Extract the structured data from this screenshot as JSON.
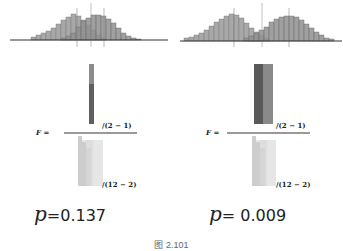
{
  "figure": {
    "caption": "图 2.101",
    "panels": [
      {
        "id": "left",
        "histogram": {
          "groupA_bins": [
            1,
            2,
            4,
            6,
            9,
            12,
            15,
            18,
            20,
            18,
            14,
            10,
            6,
            3,
            1,
            0,
            0,
            0,
            0,
            0,
            0
          ],
          "groupB_bins": [
            0,
            0,
            0,
            0,
            0,
            0,
            1,
            3,
            6,
            10,
            14,
            18,
            20,
            18,
            15,
            12,
            9,
            6,
            4,
            2,
            1
          ],
          "mean_lines": [
            "mean-A",
            "grand-mean",
            "mean-B"
          ]
        },
        "formula": {
          "label": "F =",
          "numerator_df": "/(2 − 1)",
          "denominator_df": "/(12 − 2)"
        },
        "p_label": "p",
        "p_value": "=0.137"
      },
      {
        "id": "right",
        "histogram": {
          "groupA_bins": [
            1,
            2,
            3,
            5,
            8,
            11,
            15,
            19,
            22,
            24,
            23,
            19,
            14,
            9,
            5,
            2,
            1,
            0,
            0,
            0,
            0,
            0,
            0,
            0,
            0,
            0,
            0,
            0,
            0
          ],
          "groupB_bins": [
            0,
            0,
            0,
            0,
            0,
            0,
            0,
            0,
            0,
            0,
            0,
            1,
            2,
            5,
            9,
            14,
            19,
            23,
            24,
            22,
            19,
            15,
            11,
            8,
            5,
            3,
            2,
            1,
            0
          ],
          "mean_lines": [
            "mean-A",
            "grand-mean",
            "mean-B"
          ]
        },
        "formula": {
          "label": "F =",
          "numerator_df": "/(2 − 1)",
          "denominator_df": "/(12 − 2)"
        },
        "p_label": "p",
        "p_value": "= 0.009"
      }
    ]
  },
  "colors": {
    "groupA": "#a8a8a8",
    "groupB": "#8a8a8a",
    "overlap": "#6f6f6f",
    "axis": "#333333",
    "numerator_dark": "#5a5a5a",
    "numerator_light": "#8c8c8c",
    "denominator": "#cfcfcf",
    "denominator_light": "#e4e4e4"
  }
}
